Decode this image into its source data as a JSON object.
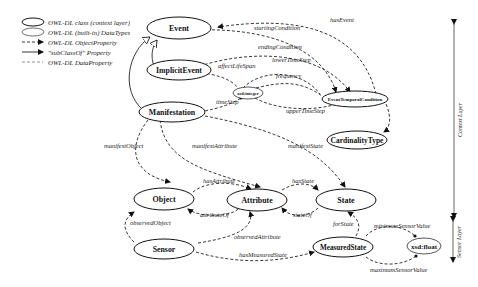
{
  "legend": {
    "items": [
      {
        "shape": "ellipse",
        "label": "OWL-DL class (context layer)"
      },
      {
        "shape": "ellipse-thin",
        "label": "OWL-DL (built-in) DataTypes"
      },
      {
        "shape": "arrow-dashed",
        "label": "OWL-DL ObjectProperty"
      },
      {
        "shape": "arrow-solid-open",
        "label": "\"subClassOf\" Property"
      },
      {
        "shape": "line-dashed",
        "label": "OWL-DL DataProperty"
      }
    ]
  },
  "nodes": {
    "event": "Event",
    "implicit_event": "ImplicitEvent",
    "manifestation": "Manifestation",
    "xsd_integer": "xsd:integer",
    "event_temporal_condition": "EventTemporalCondition",
    "cardinality_type": "CardinalityType",
    "object": "Object",
    "attribute": "Attribute",
    "state": "State",
    "sensor": "Sensor",
    "measured_state": "MeasuredState",
    "xsd_float": "xsd:float"
  },
  "edges": {
    "starting_condition": "startingCondition",
    "has_event": "hasEvent",
    "ending_condition": "endingCondition",
    "lower_time_step": "lowerTimeStep",
    "affect_life_span": "affectLifeSpan",
    "frequency": "frequency",
    "time_step": "timeStep",
    "upper_time_step": "upperTimeStep",
    "has_cardinality_type": "hasCardinalityType",
    "manifest_object": "manifestObject",
    "manifest_attribute": "manifestAttribute",
    "manifest_state": "manifestState",
    "has_attribute": "hasAttribute",
    "has_state": "hasState",
    "attribute_of": "attributeOf",
    "state_of": "stateOf",
    "observed_object": "observedObject",
    "observed_attribute": "observedAttribute",
    "for_state": "forState",
    "has_measured_state": "hasMeasuredState",
    "minimum_sensor_value": "minimumSensorValue",
    "maximum_sensor_value": "maximumSensorValue"
  },
  "layers": {
    "context": "Context Layer",
    "sensor": "Sensor Layer"
  }
}
